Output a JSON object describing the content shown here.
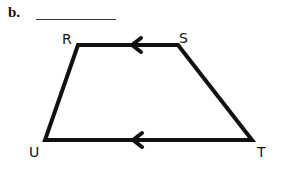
{
  "problem": {
    "label": "b.",
    "answer": ""
  },
  "diagram": {
    "shape": "trapezoid",
    "stroke_color": "#111111",
    "vertices": [
      {
        "name": "R",
        "x": 78,
        "y": 45,
        "label_x": 62,
        "label_y": 44
      },
      {
        "name": "S",
        "x": 178,
        "y": 45,
        "label_x": 179,
        "label_y": 43
      },
      {
        "name": "T",
        "x": 252,
        "y": 140,
        "label_x": 257,
        "label_y": 157
      },
      {
        "name": "U",
        "x": 45,
        "y": 140,
        "label_x": 29,
        "label_y": 157
      }
    ],
    "parallel_marks": [
      {
        "segment": "SR",
        "direction": "left"
      },
      {
        "segment": "TU",
        "direction": "left"
      }
    ]
  }
}
